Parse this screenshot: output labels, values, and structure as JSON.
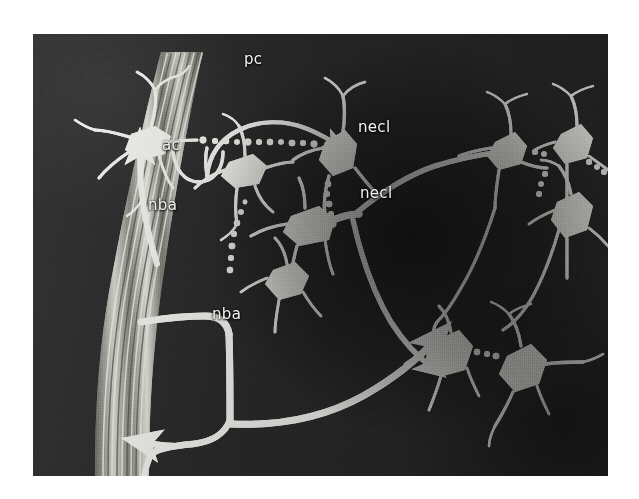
{
  "figure": {
    "type": "neuroanatomical-schematic",
    "medium": "halftone-printed-photograph",
    "plate": {
      "x": 33,
      "y": 34,
      "width": 575,
      "height": 442,
      "background_color": "#2b2b2b",
      "page_background_color": "#ffffff",
      "ink_color": "#f2f2ef"
    },
    "labels": [
      {
        "id": "pc",
        "text": "pc",
        "x": 244,
        "y": 52,
        "meaning": "preganglionic-connection"
      },
      {
        "id": "ac",
        "text": "ac",
        "x": 162,
        "y": 138,
        "meaning": "axon-collateral"
      },
      {
        "id": "nba-1",
        "text": "nba",
        "x": 148,
        "y": 198,
        "meaning": "nerve-bundle-axon-upper"
      },
      {
        "id": "nba-2",
        "text": "nba",
        "x": 212,
        "y": 307,
        "meaning": "nerve-bundle-axon-lower"
      },
      {
        "id": "necl-1",
        "text": "necl",
        "x": 358,
        "y": 120,
        "meaning": "neuron-cell-link-upper"
      },
      {
        "id": "necl-2",
        "text": "necl",
        "x": 360,
        "y": 186,
        "meaning": "neuron-cell-link-lower"
      }
    ],
    "elements": {
      "nerve_trunk": "striated-fiber-bundle-left",
      "neuron_count": 12,
      "arrowheads": 4,
      "beaded_axons": 6
    }
  }
}
